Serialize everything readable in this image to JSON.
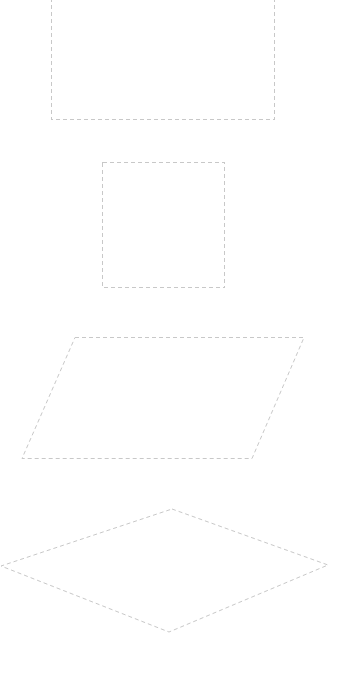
{
  "canvas": {
    "width": 341,
    "height": 675,
    "background": "#ffffff"
  },
  "style": {
    "stroke_color": "#c8c8c8",
    "stroke_width": 1,
    "dash": "4 3"
  },
  "shapes": [
    {
      "name": "rectangle",
      "kind": "rect",
      "points": "51.5,-10 274.5,-10 274.5,119.5 51.5,119.5"
    },
    {
      "name": "square",
      "kind": "rect",
      "points": "102.5,162.5 224.5,162.5 224.5,287.5 102.5,287.5"
    },
    {
      "name": "parallelogram",
      "kind": "polygon",
      "points": "75,337.5 304,337.5 252,458.5 22,458.5"
    },
    {
      "name": "diamond",
      "kind": "polygon",
      "points": "172,509 328,565 169,632 1,566"
    }
  ]
}
